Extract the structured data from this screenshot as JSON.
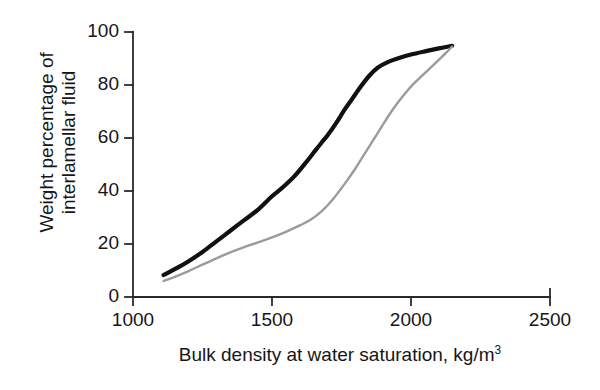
{
  "chart_data": {
    "type": "line",
    "title": "",
    "xlabel": "Bulk density at water saturation, kg/m",
    "xlabel_superscript": "3",
    "ylabel_line1": "Weight percentage of",
    "ylabel_line2": "interlamellar fluid",
    "xlim": [
      1000,
      2500
    ],
    "ylim": [
      0,
      100
    ],
    "xticks": [
      1000,
      1500,
      2000,
      2500
    ],
    "xtick_labels": [
      "1000",
      "1500",
      "2000",
      "2500"
    ],
    "yticks": [
      0,
      20,
      40,
      60,
      80,
      100
    ],
    "ytick_labels": [
      "0",
      "20",
      "40",
      "60",
      "80",
      "100"
    ],
    "grid": false,
    "legend": "none",
    "series": [
      {
        "name": "upper-curve",
        "color": "#111111",
        "line_width": 4.2,
        "points": [
          [
            1110,
            8.3
          ],
          [
            1150,
            10.5
          ],
          [
            1200,
            13.5
          ],
          [
            1250,
            17.0
          ],
          [
            1300,
            21.0
          ],
          [
            1350,
            25.0
          ],
          [
            1400,
            29.0
          ],
          [
            1450,
            33.0
          ],
          [
            1500,
            38.0
          ],
          [
            1540,
            41.5
          ],
          [
            1580,
            45.5
          ],
          [
            1620,
            50.5
          ],
          [
            1650,
            54.5
          ],
          [
            1680,
            58.5
          ],
          [
            1700,
            61.0
          ],
          [
            1730,
            65.5
          ],
          [
            1760,
            70.5
          ],
          [
            1790,
            75.0
          ],
          [
            1820,
            79.5
          ],
          [
            1850,
            83.5
          ],
          [
            1880,
            86.5
          ],
          [
            1920,
            88.8
          ],
          [
            1960,
            90.3
          ],
          [
            2000,
            91.5
          ],
          [
            2050,
            92.7
          ],
          [
            2100,
            93.8
          ],
          [
            2148,
            94.8
          ]
        ]
      },
      {
        "name": "lower-curve",
        "color": "#9b9b9b",
        "line_width": 2.4,
        "points": [
          [
            1110,
            6.0
          ],
          [
            1150,
            7.6
          ],
          [
            1200,
            9.8
          ],
          [
            1250,
            12.2
          ],
          [
            1300,
            14.6
          ],
          [
            1350,
            16.8
          ],
          [
            1400,
            18.8
          ],
          [
            1450,
            20.6
          ],
          [
            1500,
            22.5
          ],
          [
            1550,
            24.6
          ],
          [
            1600,
            27.0
          ],
          [
            1640,
            29.2
          ],
          [
            1680,
            32.5
          ],
          [
            1720,
            37.0
          ],
          [
            1760,
            42.5
          ],
          [
            1800,
            48.5
          ],
          [
            1830,
            53.5
          ],
          [
            1860,
            58.5
          ],
          [
            1890,
            63.5
          ],
          [
            1920,
            68.5
          ],
          [
            1950,
            73.0
          ],
          [
            1980,
            77.0
          ],
          [
            2010,
            80.5
          ],
          [
            2040,
            83.5
          ],
          [
            2070,
            86.5
          ],
          [
            2100,
            89.5
          ],
          [
            2125,
            92.0
          ],
          [
            2148,
            94.5
          ]
        ]
      }
    ]
  },
  "axes_geometry": {
    "x_left_px": 133,
    "x_right_px": 550,
    "y_bottom_px": 297,
    "y_top_px": 32,
    "tick_length_px": 8,
    "axis_color": "#2a2a2a",
    "axis_width": 1.8
  }
}
